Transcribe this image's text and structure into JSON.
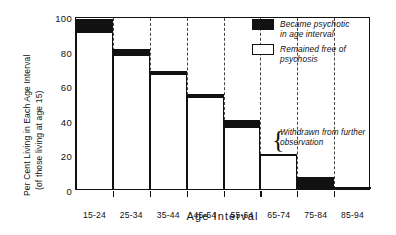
{
  "chart_data": {
    "type": "bar",
    "title": "",
    "xlabel": "Age Interval",
    "ylabel": "Per Cent Living in Each Age Interval",
    "ylabel_sub": "(of those living at age 15)",
    "categories": [
      "15-24",
      "25-34",
      "35-44",
      "45-54",
      "55-64",
      "65-74",
      "75-84",
      "85-94"
    ],
    "ylim": [
      0,
      100
    ],
    "yticks": [
      "0",
      "20",
      "40",
      "60",
      "80",
      "100"
    ],
    "ytick_values": [
      0,
      20,
      40,
      60,
      80,
      100
    ],
    "grid": "vertical-dashed",
    "legend_position": "top-right",
    "series": [
      {
        "name": "Remained free of psychosis",
        "color": "#ffffff",
        "values": [
          90,
          77,
          66,
          52.5,
          35,
          20,
          0,
          0
        ]
      },
      {
        "name": "Became psychotic in age interval",
        "color": "#111111",
        "values": [
          8,
          4,
          2,
          2.5,
          5,
          0,
          7,
          0.8
        ]
      }
    ],
    "totals": [
      98,
      81,
      68,
      55,
      40,
      20,
      7,
      0.8
    ],
    "annotations": [
      {
        "text_line1": "Withdrawn from further",
        "text_line2": "observation",
        "marker": "curly-brace",
        "at_category": "65-74"
      }
    ]
  },
  "legend": {
    "items": [
      {
        "swatch": "filled",
        "line1": "Became psychotic",
        "line2": "in age interval"
      },
      {
        "swatch": "empty",
        "line1": "Remained free of",
        "line2": "psychosis"
      }
    ]
  },
  "colors": {
    "psychotic": "#111111",
    "free": "#ffffff",
    "axis": "#111111",
    "gridline": "#444444"
  }
}
